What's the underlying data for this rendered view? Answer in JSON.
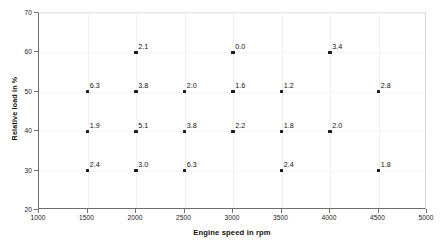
{
  "chart_data": {
    "type": "scatter",
    "title": "",
    "xlabel": "Engine speed in rpm",
    "ylabel": "Relative load in %",
    "xlim": [
      1000,
      5000
    ],
    "ylim": [
      20,
      70
    ],
    "xticks": [
      1000,
      1500,
      2000,
      2500,
      3000,
      3500,
      4000,
      4500,
      5000
    ],
    "yticks": [
      20,
      30,
      40,
      50,
      60,
      70
    ],
    "xtick_labels": [
      "1000",
      "1500",
      "2000",
      "2500",
      "3000",
      "3500",
      "4000",
      "4500",
      "5000"
    ],
    "ytick_labels": [
      "20",
      "30",
      "40",
      "50",
      "60",
      "70"
    ],
    "grid": true,
    "legend": false,
    "marker_color": "#1b1b1b",
    "axis_color": "#6e6e6e",
    "grid_color": "#f0f0f0",
    "background": "#ffffff",
    "point_label_format": "one-decimal",
    "points": [
      {
        "x": 2000,
        "y": 60,
        "label": "2.1"
      },
      {
        "x": 3000,
        "y": 60,
        "label": "0.0"
      },
      {
        "x": 4000,
        "y": 60,
        "label": "3.4"
      },
      {
        "x": 1500,
        "y": 50,
        "label": "6.3"
      },
      {
        "x": 2000,
        "y": 50,
        "label": "3.8"
      },
      {
        "x": 2500,
        "y": 50,
        "label": "2.0"
      },
      {
        "x": 3000,
        "y": 50,
        "label": "1.6"
      },
      {
        "x": 3500,
        "y": 50,
        "label": "1.2"
      },
      {
        "x": 4500,
        "y": 50,
        "label": "2.8"
      },
      {
        "x": 1500,
        "y": 40,
        "label": "1.9"
      },
      {
        "x": 2000,
        "y": 40,
        "label": "5.1"
      },
      {
        "x": 2500,
        "y": 40,
        "label": "3.8"
      },
      {
        "x": 3000,
        "y": 40,
        "label": "2.2"
      },
      {
        "x": 3500,
        "y": 40,
        "label": "1.8"
      },
      {
        "x": 4000,
        "y": 40,
        "label": "2.0"
      },
      {
        "x": 1500,
        "y": 30,
        "label": "2.4"
      },
      {
        "x": 2000,
        "y": 30,
        "label": "3.0"
      },
      {
        "x": 2500,
        "y": 30,
        "label": "6.3"
      },
      {
        "x": 3500,
        "y": 30,
        "label": "2.4"
      },
      {
        "x": 4500,
        "y": 30,
        "label": "1.8"
      }
    ]
  }
}
